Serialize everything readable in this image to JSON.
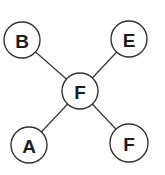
{
  "diagram": {
    "type": "star-graph",
    "nodes": [
      {
        "id": "center",
        "label": "F",
        "cx": 80,
        "cy": 91,
        "r": 18
      },
      {
        "id": "top-left",
        "label": "B",
        "cx": 22,
        "cy": 40,
        "r": 18
      },
      {
        "id": "top-right",
        "label": "E",
        "cx": 129,
        "cy": 39,
        "r": 18
      },
      {
        "id": "bottom-left",
        "label": "A",
        "cx": 29,
        "cy": 145,
        "r": 18
      },
      {
        "id": "bottom-right",
        "label": "F",
        "cx": 129,
        "cy": 143,
        "r": 19
      }
    ],
    "edges": [
      {
        "from": "center",
        "to": "top-left"
      },
      {
        "from": "center",
        "to": "top-right"
      },
      {
        "from": "center",
        "to": "bottom-left"
      },
      {
        "from": "center",
        "to": "bottom-right"
      }
    ],
    "colors": {
      "stroke": "#333333",
      "text": "#1e1e1e",
      "fill": "#ffffff"
    }
  }
}
